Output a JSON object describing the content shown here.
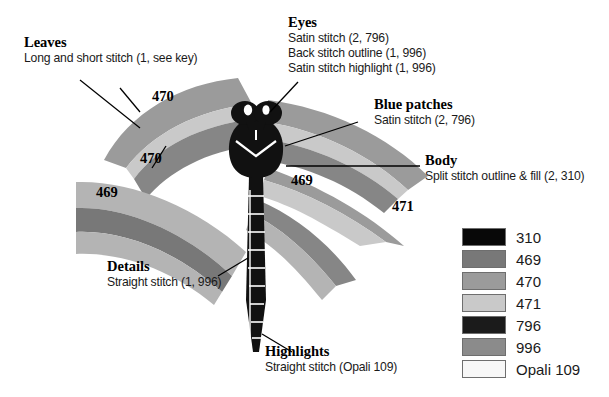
{
  "diagram": {
    "wing_labels": [
      {
        "text": "470",
        "x": 152,
        "y": 96
      },
      {
        "text": "470",
        "x": 140,
        "y": 158
      },
      {
        "text": "469",
        "x": 96,
        "y": 192
      },
      {
        "text": "469",
        "x": 291,
        "y": 180
      },
      {
        "text": "471",
        "x": 392,
        "y": 206
      }
    ]
  },
  "callouts": {
    "leaves": {
      "title": "Leaves",
      "lines": [
        "Long and short stitch (1, see key)"
      ]
    },
    "eyes": {
      "title": "Eyes",
      "lines": [
        "Satin stitch (2, 796)",
        "Back stitch outline (1, 996)",
        "Satin stitch highlight (1, 996)"
      ]
    },
    "blue_patches": {
      "title": "Blue patches",
      "lines": [
        "Satin stitch (2, 796)"
      ]
    },
    "body": {
      "title": "Body",
      "lines": [
        "Split stitch outline & fill (2, 310)"
      ]
    },
    "details": {
      "title": "Details",
      "lines": [
        "Straight stitch (1, 996)"
      ]
    },
    "highlights": {
      "title": "Highlights",
      "lines": [
        "Straight stitch (Opali 109)"
      ]
    }
  },
  "legend": {
    "items": [
      {
        "label": "310",
        "color": "#080808"
      },
      {
        "label": "469",
        "color": "#787878"
      },
      {
        "label": "470",
        "color": "#9b9b9b"
      },
      {
        "label": "471",
        "color": "#c9c9c9"
      },
      {
        "label": "796",
        "color": "#1b1b1b"
      },
      {
        "label": "996",
        "color": "#8b8b8b"
      },
      {
        "label": "Opali 109",
        "color": "#f7f7f7"
      }
    ]
  },
  "colors": {
    "wing_dark": "#787878",
    "wing_mid": "#9b9b9b",
    "wing_light": "#c9c9c9",
    "body_black": "#111111",
    "background": "#ffffff"
  }
}
